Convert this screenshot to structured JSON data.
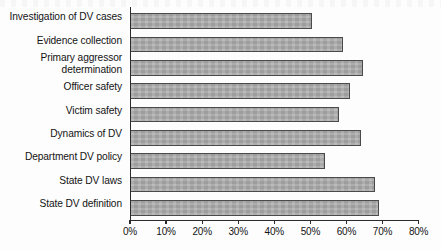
{
  "chart_data": {
    "type": "bar",
    "orientation": "horizontal",
    "title": "",
    "xlabel": "",
    "ylabel": "",
    "xlim": [
      0,
      80
    ],
    "xtick_labels": [
      "0%",
      "10%",
      "20%",
      "30%",
      "40%",
      "50%",
      "60%",
      "70%",
      "80%"
    ],
    "xticks": [
      0,
      10,
      20,
      30,
      40,
      50,
      60,
      70,
      80
    ],
    "grid": false,
    "legend": false,
    "bar_color": "#a8a8a8",
    "bar_edge_color": "#4a4a4a",
    "categories": [
      "Investigation of DV cases",
      "Evidence collection",
      "Primary aggressor\ndetermination",
      "Officer safety",
      "Victim safety",
      "Dynamics of DV",
      "Department DV policy",
      "State DV laws",
      "State DV definition"
    ],
    "values": [
      50.5,
      59,
      64.5,
      61,
      58,
      64,
      54,
      68,
      69
    ],
    "value_labels": [
      "50.5%",
      "59%",
      "64.5%",
      "61%",
      "58%",
      "64%",
      "54%",
      "68%",
      "69%"
    ]
  }
}
